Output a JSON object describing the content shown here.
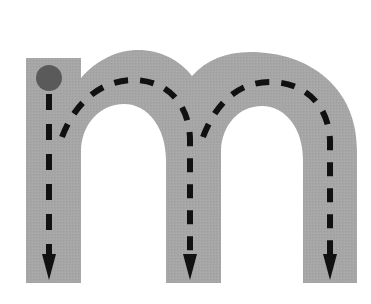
{
  "figure": {
    "letter": "m",
    "colors": {
      "background": "#ffffff",
      "letter_fill": "#a6a6a6",
      "start_dot": "#5a5a5a",
      "stroke_path": "#111111"
    },
    "start_point": {
      "x": 49,
      "y": 78,
      "r": 13
    },
    "strokes": [
      {
        "name": "left-stem-down",
        "direction": "down"
      },
      {
        "name": "first-arch-then-down",
        "direction": "over-and-down"
      },
      {
        "name": "second-arch-then-down",
        "direction": "over-and-down"
      }
    ]
  }
}
